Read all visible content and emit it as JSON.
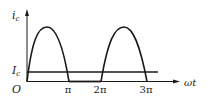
{
  "diagram": {
    "title": "",
    "y_axis": {
      "label": "i",
      "label_sub": "c"
    },
    "x_axis": {
      "label": "ωt"
    },
    "origin_label": "O",
    "level_line": {
      "label": "I",
      "label_sub": "c"
    },
    "ticks": [
      {
        "label": "π"
      },
      {
        "label": "2π"
      },
      {
        "label": "3π"
      }
    ],
    "curve": "half-wave rectified sine: positive humps from 0 to π and 2π to 3π, zero from π to 2π",
    "colors": {
      "stroke": "#1a1a1a",
      "background": "#ffffff"
    }
  }
}
